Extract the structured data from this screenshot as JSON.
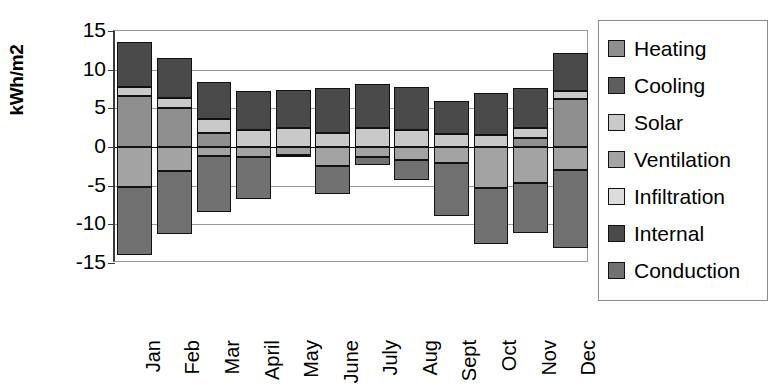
{
  "chart_data": {
    "type": "bar",
    "stacked": true,
    "title": "",
    "xlabel": "",
    "ylabel": "kWh/m2",
    "ylim": [
      -15,
      15
    ],
    "yticks": [
      15,
      10,
      5,
      0,
      -5,
      -10,
      -15
    ],
    "ytick_labels": [
      "15",
      "10",
      "5",
      "0",
      "-5",
      "-10",
      "-15"
    ],
    "grid": true,
    "legend_position": "right",
    "categories": [
      "Jan",
      "Feb",
      "Mar",
      "April",
      "May",
      "June",
      "July",
      "Aug",
      "Sept",
      "Oct",
      "Nov",
      "Dec"
    ],
    "series": [
      {
        "name": "Heating",
        "color": "#8f8f8f",
        "values": [
          6.6,
          5.0,
          1.8,
          0.0,
          0.0,
          0.0,
          0.0,
          0.0,
          0.0,
          0.0,
          1.2,
          6.2
        ]
      },
      {
        "name": "Cooling",
        "color": "#5e5e5e",
        "values": [
          0.0,
          0.0,
          0.0,
          0.0,
          0.0,
          0.0,
          0.0,
          0.0,
          0.0,
          0.0,
          0.0,
          0.0
        ]
      },
      {
        "name": "Solar",
        "color": "#c9c9c9",
        "values": [
          1.1,
          1.4,
          1.8,
          2.2,
          2.4,
          1.8,
          2.4,
          2.2,
          1.7,
          1.6,
          1.3,
          1.1
        ]
      },
      {
        "name": "Ventilation",
        "color": "#a3a3a3",
        "values": [
          -5.2,
          -3.1,
          -1.2,
          -1.3,
          -1.0,
          -2.5,
          -1.3,
          -1.7,
          -2.1,
          -5.3,
          -4.6,
          -3.0
        ]
      },
      {
        "name": "Infiltration",
        "color": "#dcdcdc",
        "values": [
          0.0,
          0.0,
          0.0,
          0.0,
          0.0,
          0.0,
          0.0,
          0.0,
          0.0,
          0.0,
          0.0,
          0.0
        ]
      },
      {
        "name": "Internal",
        "color": "#4a4a4a",
        "values": [
          5.9,
          5.1,
          4.8,
          5.1,
          5.0,
          5.8,
          5.8,
          5.5,
          4.3,
          5.4,
          5.1,
          4.8
        ]
      },
      {
        "name": "Conduction",
        "color": "#717171",
        "values": [
          -8.8,
          -8.1,
          -7.2,
          -5.4,
          -0.3,
          -3.6,
          -1.0,
          -2.6,
          -6.8,
          -7.3,
          -6.5,
          -10.0
        ]
      }
    ]
  },
  "legend": {
    "items": [
      {
        "label": "Heating",
        "color": "#8f8f8f"
      },
      {
        "label": "Cooling",
        "color": "#5e5e5e"
      },
      {
        "label": "Solar",
        "color": "#c9c9c9"
      },
      {
        "label": "Ventilation",
        "color": "#a3a3a3"
      },
      {
        "label": "Infiltration",
        "color": "#dcdcdc"
      },
      {
        "label": "Internal",
        "color": "#4a4a4a"
      },
      {
        "label": "Conduction",
        "color": "#717171"
      }
    ]
  }
}
